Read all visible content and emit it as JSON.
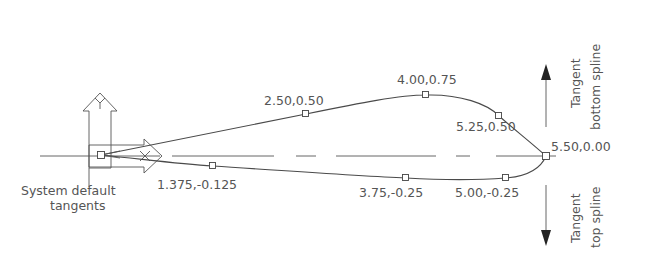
{
  "diagram": {
    "type": "spline-with-tangents",
    "center_line": "dashed horizontal axis",
    "origin_label": [
      "System default",
      "tangents"
    ],
    "axis_icons": {
      "x": "X",
      "y": "Y"
    },
    "points": [
      {
        "label": "1.375,-0.125",
        "x": 1.375,
        "y": -0.125
      },
      {
        "label": "2.50,0.50",
        "x": 2.5,
        "y": 0.5
      },
      {
        "label": "4.00,0.75",
        "x": 4.0,
        "y": 0.75
      },
      {
        "label": "5.25,0.50",
        "x": 5.25,
        "y": 0.5
      },
      {
        "label": "5.50,0.00",
        "x": 5.5,
        "y": 0.0
      },
      {
        "label": "3.75,-0.25",
        "x": 3.75,
        "y": -0.25
      },
      {
        "label": "5.00,-0.25",
        "x": 5.0,
        "y": -0.25
      }
    ],
    "tangent_up": {
      "line1": "Tangent",
      "line2": "bottom spline"
    },
    "tangent_down": {
      "line1": "Tangent",
      "line2": "top spline"
    },
    "colors": {
      "line": "#4a4a4a",
      "text": "#555555",
      "background": "#ffffff"
    }
  }
}
